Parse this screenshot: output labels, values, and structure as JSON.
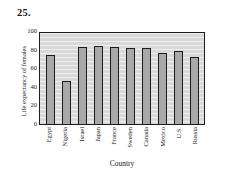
{
  "problem": {
    "number": "25."
  },
  "chart_data": {
    "type": "bar",
    "title": "",
    "xlabel": "Country",
    "ylabel": "Life expectancy of females",
    "categories": [
      "Egypt",
      "Nigeria",
      "Israel",
      "Japan",
      "France",
      "Sweden",
      "Canada",
      "Mexico",
      "U.S.",
      "Russia"
    ],
    "values": [
      74,
      46,
      83,
      84,
      83,
      82,
      82,
      76,
      79,
      72
    ],
    "ylim": [
      0,
      100
    ],
    "yticks": [
      0,
      20,
      40,
      60,
      80,
      100
    ],
    "ytick_labels": [
      "0",
      "20",
      "40",
      "60",
      "80",
      "100"
    ],
    "grid": false,
    "legend": null,
    "colors": {
      "bar_fill": "#a9a9a9",
      "bar_edge": "#1d1d1d",
      "plot_background": "#d9d9d9",
      "page_background": "#ffffff",
      "text": "#1a1a1a"
    }
  }
}
